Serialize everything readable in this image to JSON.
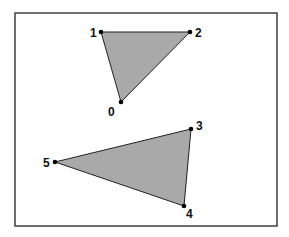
{
  "diagram": {
    "frame": {
      "x": 15,
      "y": 13,
      "width": 262,
      "height": 213
    },
    "colors": {
      "fill": "#a9a9a9",
      "stroke": "#222222",
      "vertex": "#000000",
      "frame": "#333333"
    },
    "vertices": [
      {
        "id": "0",
        "label": "0",
        "x": 121,
        "y": 102,
        "lx": 108,
        "ly": 116
      },
      {
        "id": "1",
        "label": "1",
        "x": 101,
        "y": 32,
        "lx": 90,
        "ly": 37
      },
      {
        "id": "2",
        "label": "2",
        "x": 190,
        "y": 32,
        "lx": 195,
        "ly": 37
      },
      {
        "id": "3",
        "label": "3",
        "x": 191,
        "y": 129,
        "lx": 196,
        "ly": 130
      },
      {
        "id": "4",
        "label": "4",
        "x": 184,
        "y": 206,
        "lx": 186,
        "ly": 218
      },
      {
        "id": "5",
        "label": "5",
        "x": 55,
        "y": 162,
        "lx": 43,
        "ly": 167
      }
    ],
    "triangles": [
      {
        "name": "upper-triangle",
        "vertices": [
          "0",
          "1",
          "2"
        ]
      },
      {
        "name": "lower-triangle",
        "vertices": [
          "3",
          "4",
          "5"
        ]
      }
    ]
  }
}
